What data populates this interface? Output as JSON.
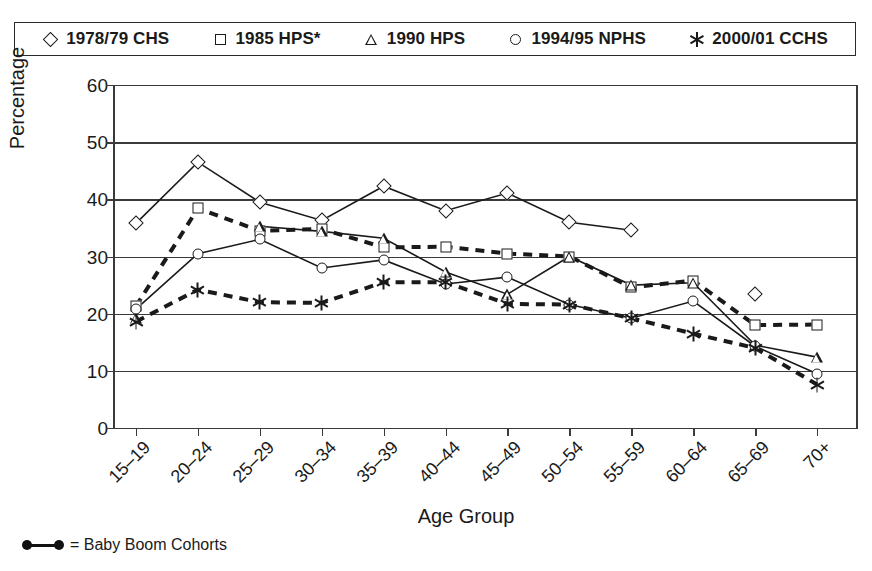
{
  "legend": {
    "items": [
      {
        "symbol": "diamond",
        "label": "1978/79 CHS"
      },
      {
        "symbol": "square",
        "label": "1985 HPS*"
      },
      {
        "symbol": "triangle",
        "label": "1990 HPS"
      },
      {
        "symbol": "circle",
        "label": "1994/95 NPHS"
      },
      {
        "symbol": "star",
        "label": "2000/01 CCHS"
      }
    ]
  },
  "footnote": {
    "symbol": "baby-boom-line",
    "text": "= Baby Boom Cohorts"
  },
  "colors": {
    "ink": "#1a1a1a",
    "axis": "#3a3a3a",
    "background": "#ffffff"
  },
  "chart_data": {
    "type": "line",
    "title": "",
    "xlabel": "Age Group",
    "ylabel": "Percentage",
    "ylim": [
      0,
      60
    ],
    "ytick_step": 10,
    "yticks": [
      "0",
      "10",
      "20",
      "30",
      "40",
      "50",
      "60"
    ],
    "grid": true,
    "legend_position": "top",
    "categories": [
      "15–19",
      "20–24",
      "25–29",
      "30–34",
      "35–39",
      "40–44",
      "45–49",
      "50–54",
      "55–59",
      "60–64",
      "65–69",
      "70+"
    ],
    "series": [
      {
        "name": "1978/79 CHS",
        "symbol": "diamond",
        "linestyle": "solid",
        "values": [
          35.8,
          46.5,
          39.5,
          36.3,
          42.3,
          38.0,
          41.1,
          36.0,
          34.6,
          null,
          23.4,
          null
        ]
      },
      {
        "name": "1985 HPS*",
        "symbol": "square",
        "linestyle": "dashed",
        "values": [
          21.3,
          38.4,
          34.5,
          34.8,
          31.6,
          31.7,
          30.5,
          30.0,
          24.6,
          25.8,
          18.0,
          18.1
        ]
      },
      {
        "name": "1990 HPS",
        "symbol": "triangle",
        "linestyle": "solid",
        "values": [
          19.2,
          null,
          35.3,
          34.4,
          33.2,
          27.3,
          23.4,
          30.0,
          25.0,
          25.4,
          14.5,
          12.4
        ]
      },
      {
        "name": "1994/95 NPHS",
        "symbol": "circle",
        "linestyle": "solid",
        "values": [
          20.8,
          30.5,
          33.0,
          28.0,
          29.4,
          25.2,
          26.4,
          21.6,
          19.2,
          22.2,
          14.3,
          9.5
        ]
      },
      {
        "name": "2000/01 CCHS",
        "symbol": "star",
        "linestyle": "dashed",
        "values": [
          18.6,
          24.2,
          22.0,
          21.9,
          25.5,
          25.5,
          21.7,
          21.6,
          19.2,
          16.5,
          14.0,
          7.6
        ]
      }
    ]
  }
}
